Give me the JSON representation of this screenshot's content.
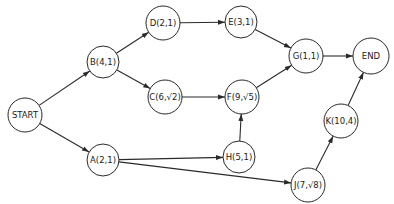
{
  "diagram": {
    "type": "activity-network",
    "nodes": [
      {
        "id": "START",
        "label": "START"
      },
      {
        "id": "A",
        "label": "A(2,1)"
      },
      {
        "id": "B",
        "label": "B(4,1)"
      },
      {
        "id": "C",
        "label": "C(6,√2)"
      },
      {
        "id": "D",
        "label": "D(2,1)"
      },
      {
        "id": "E",
        "label": "E(3,1)"
      },
      {
        "id": "F",
        "label": "F(9,√5)"
      },
      {
        "id": "G",
        "label": "G(1,1)"
      },
      {
        "id": "H",
        "label": "H(5,1)"
      },
      {
        "id": "J",
        "label": "J(7,√8)"
      },
      {
        "id": "K",
        "label": "K(10,4)"
      },
      {
        "id": "END",
        "label": "END"
      }
    ],
    "edges": [
      {
        "from": "START",
        "to": "B"
      },
      {
        "from": "START",
        "to": "A"
      },
      {
        "from": "B",
        "to": "D"
      },
      {
        "from": "B",
        "to": "C"
      },
      {
        "from": "D",
        "to": "E"
      },
      {
        "from": "E",
        "to": "G"
      },
      {
        "from": "C",
        "to": "F"
      },
      {
        "from": "F",
        "to": "G"
      },
      {
        "from": "G",
        "to": "END"
      },
      {
        "from": "A",
        "to": "H"
      },
      {
        "from": "A",
        "to": "J"
      },
      {
        "from": "H",
        "to": "F"
      },
      {
        "from": "J",
        "to": "K"
      },
      {
        "from": "K",
        "to": "END"
      }
    ]
  }
}
